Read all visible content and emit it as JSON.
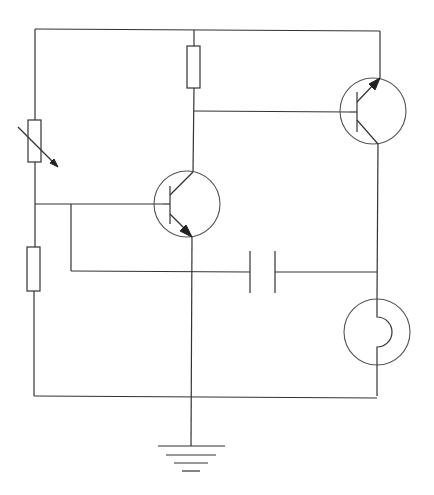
{
  "diagram": {
    "type": "electronic circuit schematic",
    "background": "#ffffff",
    "line_color": "#333333",
    "components": [
      {
        "id": "R_var",
        "kind": "variable-resistor",
        "position": "left-upper branch",
        "label": ""
      },
      {
        "id": "R1",
        "kind": "resistor",
        "position": "left-lower branch",
        "label": ""
      },
      {
        "id": "R2",
        "kind": "resistor",
        "position": "top-middle (collector load of T1)",
        "label": ""
      },
      {
        "id": "T1",
        "kind": "npn-transistor",
        "position": "center",
        "label": ""
      },
      {
        "id": "T2",
        "kind": "pnp-transistor",
        "position": "top-right",
        "label": ""
      },
      {
        "id": "C1",
        "kind": "capacitor",
        "position": "middle-right horizontal",
        "label": ""
      },
      {
        "id": "L1",
        "kind": "lamp",
        "position": "bottom-right",
        "label": ""
      },
      {
        "id": "GND",
        "kind": "ground",
        "position": "bottom-center",
        "label": ""
      }
    ],
    "text_labels": []
  }
}
